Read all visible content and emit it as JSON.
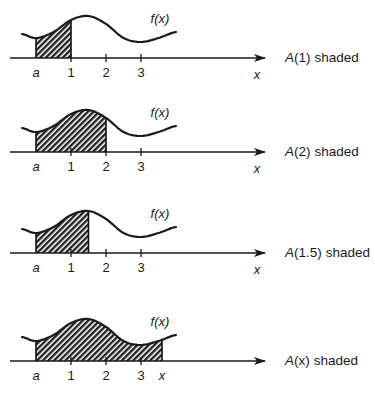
{
  "chart_data": {
    "type": "area",
    "title": "",
    "function_label": "f(x)",
    "x_axis_label": "x",
    "lower_limit_label": "a",
    "tick_labels": [
      "1",
      "2",
      "3"
    ],
    "curve_shape": [
      {
        "x": -0.4,
        "y": 0.55
      },
      {
        "x": 0.0,
        "y": 0.45
      },
      {
        "x": 0.5,
        "y": 0.6
      },
      {
        "x": 1.0,
        "y": 0.9
      },
      {
        "x": 1.5,
        "y": 1.0
      },
      {
        "x": 2.0,
        "y": 0.8
      },
      {
        "x": 2.5,
        "y": 0.45
      },
      {
        "x": 3.0,
        "y": 0.35
      },
      {
        "x": 3.5,
        "y": 0.45
      },
      {
        "x": 4.0,
        "y": 0.6
      }
    ],
    "panels": [
      {
        "caption_prefix": "A",
        "caption_arg": "(1)",
        "caption_suffix": "shaded",
        "shade_to": 1.0,
        "upper_label": "1"
      },
      {
        "caption_prefix": "A",
        "caption_arg": "(2)",
        "caption_suffix": "shaded",
        "shade_to": 2.0,
        "upper_label": "2"
      },
      {
        "caption_prefix": "A",
        "caption_arg": "(1.5)",
        "caption_suffix": "shaded",
        "shade_to": 1.5,
        "upper_label": "1.5"
      },
      {
        "caption_prefix": "A",
        "caption_arg": "(x)",
        "caption_suffix": "shaded",
        "shade_to": 3.6,
        "upper_label": "x"
      }
    ]
  }
}
